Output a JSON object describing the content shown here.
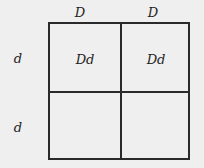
{
  "punnett": {
    "column_headers": [
      "D",
      "D"
    ],
    "row_headers": [
      "d",
      "d"
    ],
    "cells": [
      [
        "Dd",
        "Dd"
      ],
      [
        "",
        ""
      ]
    ]
  }
}
